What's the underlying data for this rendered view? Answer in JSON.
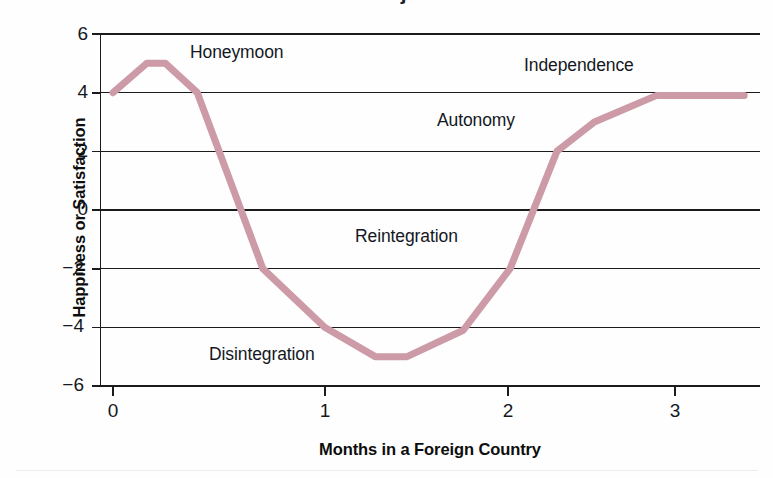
{
  "figure": {
    "partial_title_fragment": "Culture Shock: Phases of Adjustment",
    "line_color": "#cd9aa7",
    "axis_color": "#1b1b1b",
    "background": "#fefefe"
  },
  "chart_data": {
    "type": "line",
    "title": "",
    "xlabel": "Months in a Foreign Country",
    "ylabel": "Happiness or Satisfaction",
    "xlim": [
      0,
      3.4
    ],
    "ylim": [
      -6,
      6
    ],
    "xticks": [
      0,
      1,
      2,
      3
    ],
    "xtick_labels": [
      "0",
      "1",
      "2",
      "3"
    ],
    "yticks": [
      6,
      4,
      2,
      0,
      -2,
      -4,
      -6
    ],
    "ytick_labels": [
      "6",
      "4",
      "2",
      "0",
      "−2",
      "−4",
      "−6"
    ],
    "grid": "horizontal",
    "legend": "none",
    "series": [
      {
        "name": "Adjustment curve",
        "color": "#cd9aa7",
        "x": [
          0.0,
          0.18,
          0.28,
          0.45,
          0.8,
          1.13,
          1.4,
          1.57,
          1.87,
          2.12,
          2.37,
          2.57,
          2.9,
          3.37
        ],
        "y": [
          4.0,
          5.0,
          5.0,
          4.0,
          -2.0,
          -4.0,
          -5.0,
          -5.0,
          -4.1,
          -2.0,
          2.0,
          3.0,
          3.9,
          3.9
        ]
      }
    ],
    "annotations": [
      {
        "text": "Honeymoon",
        "x": 1.38,
        "y": 5.3
      },
      {
        "text": "Independence",
        "x": 3.08,
        "y": 4.75
      },
      {
        "text": "Autonomy",
        "x": 2.56,
        "y": 3.05
      },
      {
        "text": "Reintegration",
        "x": 2.22,
        "y": -1.1
      },
      {
        "text": "Disintegration",
        "x": 1.49,
        "y": -4.9
      }
    ]
  },
  "annotation_positions_px": [
    {
      "name": "honeymoon",
      "left": 190,
      "top": 42
    },
    {
      "name": "independence",
      "left": 524,
      "top": 55
    },
    {
      "name": "autonomy",
      "left": 437,
      "top": 110
    },
    {
      "name": "reintegration",
      "left": 355,
      "top": 226
    },
    {
      "name": "disintegration",
      "left": 209,
      "top": 344
    }
  ],
  "ytick_positions_px": [
    {
      "label": "6",
      "top": 23,
      "value": 6
    },
    {
      "label": "4",
      "top": 81,
      "value": 4
    },
    {
      "label": "2",
      "top": 140,
      "value": 2
    },
    {
      "label": "0",
      "top": 198,
      "value": 0
    },
    {
      "label": "−2",
      "top": 257,
      "value": -2
    },
    {
      "label": "−4",
      "top": 315,
      "value": -4
    },
    {
      "label": "−6",
      "top": 374,
      "value": -6
    }
  ],
  "xtick_positions_px": [
    {
      "label": "0",
      "left": 93,
      "value": 0
    },
    {
      "label": "1",
      "left": 305,
      "value": 1
    },
    {
      "label": "2",
      "left": 488,
      "value": 2
    },
    {
      "label": "3",
      "left": 655,
      "value": 3
    }
  ]
}
